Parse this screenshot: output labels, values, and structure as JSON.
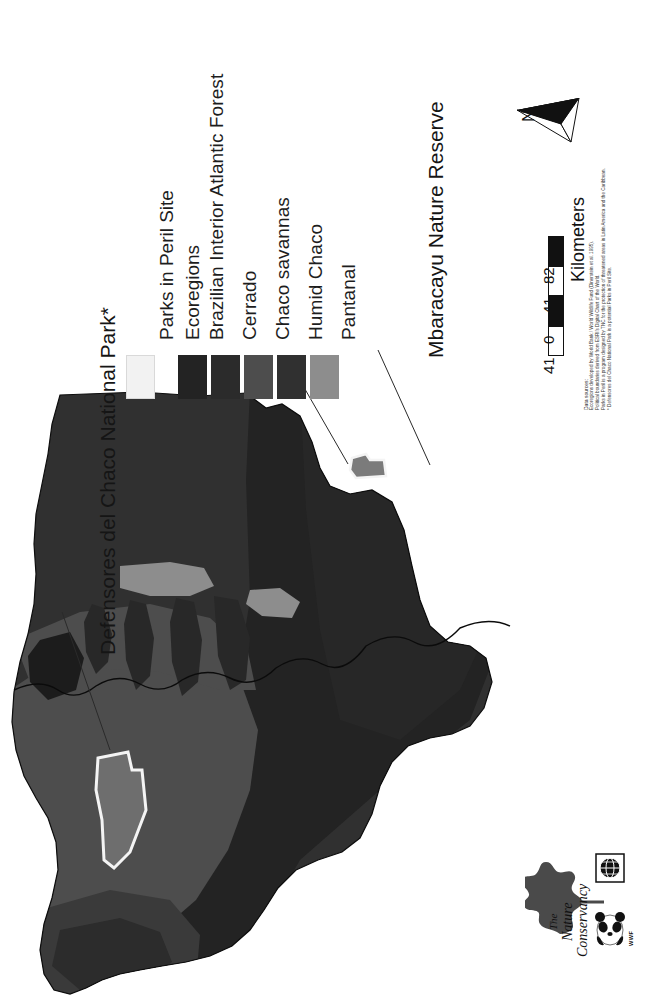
{
  "map": {
    "title_primary": "Defensores del Chaco National Park*",
    "title_secondary": "Mbaracayu Nature Reserve",
    "region": "Paraguay"
  },
  "legend": {
    "site_heading": "Parks in Peril Site",
    "site_swatch_color": "#f2f2f2",
    "ecoregions_heading": "Ecoregions",
    "ecoregions": [
      {
        "label": "Brazilian Interior Atlantic Forest",
        "color": "#232323"
      },
      {
        "label": "Cerrado",
        "color": "#2b2b2b"
      },
      {
        "label": "Chaco savannas",
        "color": "#4d4d4d"
      },
      {
        "label": "Humid Chaco",
        "color": "#303030"
      },
      {
        "label": "Pantanal",
        "color": "#8d8d8d"
      }
    ]
  },
  "north_arrow": {
    "label": "N",
    "icon": "north-arrow-icon"
  },
  "scale_bar": {
    "unit": "Kilometers",
    "ticks": [
      "41",
      "0",
      "41",
      "82"
    ]
  },
  "credits": {
    "heading": "Data sources:",
    "lines": [
      "Ecoregions developed by World Bank / World Wildlife Fund (Dinerstein et al. 1995).",
      "Political boundaries derived from ESRI's Digital Chart of the World.",
      "Parks in Peril is a program designed by TNC for the protection of threatened areas in Latin America and the Caribbean.",
      "* Defensores del Chaco National Park is a potential Parks in Peril Site."
    ]
  },
  "logos": {
    "tnc": {
      "line1": "The",
      "line2": "Nature",
      "line3": "Conservancy",
      "mark": "oak-leaf-icon"
    },
    "wwf": {
      "label": "WWF",
      "mark": "panda-icon",
      "globe": "globe-icon"
    }
  }
}
